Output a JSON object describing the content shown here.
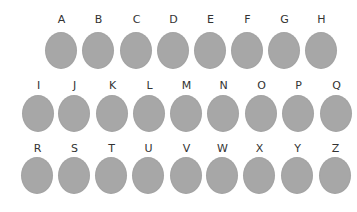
{
  "disc_color": "#a7a7a7",
  "label_color": "#333333",
  "rows": [
    {
      "label_top": 14,
      "disc_top": 32,
      "items": [
        {
          "letter": "A",
          "x": 45
        },
        {
          "letter": "B",
          "x": 82
        },
        {
          "letter": "C",
          "x": 120
        },
        {
          "letter": "D",
          "x": 157
        },
        {
          "letter": "E",
          "x": 194
        },
        {
          "letter": "F",
          "x": 231
        },
        {
          "letter": "G",
          "x": 268
        },
        {
          "letter": "H",
          "x": 305
        }
      ]
    },
    {
      "label_top": 80,
      "disc_top": 95,
      "items": [
        {
          "letter": "I",
          "x": 22
        },
        {
          "letter": "J",
          "x": 58
        },
        {
          "letter": "K",
          "x": 96
        },
        {
          "letter": "L",
          "x": 133
        },
        {
          "letter": "M",
          "x": 170
        },
        {
          "letter": "N",
          "x": 207
        },
        {
          "letter": "O",
          "x": 245
        },
        {
          "letter": "P",
          "x": 282
        },
        {
          "letter": "Q",
          "x": 320
        }
      ]
    },
    {
      "label_top": 143,
      "disc_top": 157,
      "items": [
        {
          "letter": "R",
          "x": 21
        },
        {
          "letter": "S",
          "x": 58
        },
        {
          "letter": "T",
          "x": 95
        },
        {
          "letter": "U",
          "x": 132
        },
        {
          "letter": "V",
          "x": 170
        },
        {
          "letter": "W",
          "x": 206
        },
        {
          "letter": "X",
          "x": 243
        },
        {
          "letter": "Y",
          "x": 281
        },
        {
          "letter": "Z",
          "x": 319
        }
      ]
    }
  ]
}
